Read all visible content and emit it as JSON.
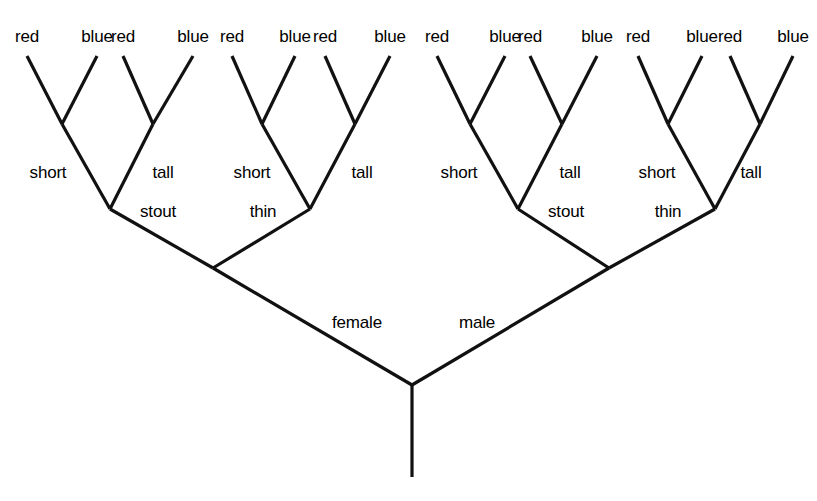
{
  "diagram": {
    "kind": "decision-tree",
    "title": "",
    "background_color": "#ffffff",
    "line_color": "#111111",
    "text_color": "#000000",
    "root": {
      "label": "",
      "stem": true
    },
    "level1": {
      "labels": [
        "female",
        "male"
      ]
    },
    "level2": {
      "labels": [
        "stout",
        "thin",
        "stout",
        "thin"
      ]
    },
    "level3": {
      "labels": [
        "short",
        "tall",
        "short",
        "tall",
        "short",
        "tall",
        "short",
        "tall"
      ]
    },
    "leaves": {
      "labels": [
        "red",
        "blue",
        "red",
        "blue",
        "red",
        "blue",
        "red",
        "blue",
        "red",
        "blue",
        "red",
        "blue",
        "red",
        "blue",
        "red",
        "blue"
      ]
    }
  },
  "chart_data": {
    "type": "diagram",
    "title": "",
    "structure": "binary decision tree, 4 levels of splits, 16 leaves",
    "splits": [
      {
        "level": 1,
        "attribute": "sex",
        "values": [
          "female",
          "male"
        ]
      },
      {
        "level": 2,
        "attribute": "build",
        "values": [
          "stout",
          "thin"
        ]
      },
      {
        "level": 3,
        "attribute": "height",
        "values": [
          "short",
          "tall"
        ]
      },
      {
        "level": 4,
        "attribute": "color",
        "values": [
          "red",
          "blue"
        ]
      }
    ],
    "leaf_count": 16,
    "leaf_labels": [
      "red",
      "blue",
      "red",
      "blue",
      "red",
      "blue",
      "red",
      "blue",
      "red",
      "blue",
      "red",
      "blue",
      "red",
      "blue",
      "red",
      "blue"
    ],
    "paths": [
      [
        "female",
        "stout",
        "short",
        "red"
      ],
      [
        "female",
        "stout",
        "short",
        "blue"
      ],
      [
        "female",
        "stout",
        "tall",
        "red"
      ],
      [
        "female",
        "stout",
        "tall",
        "blue"
      ],
      [
        "female",
        "thin",
        "short",
        "red"
      ],
      [
        "female",
        "thin",
        "short",
        "blue"
      ],
      [
        "female",
        "thin",
        "tall",
        "red"
      ],
      [
        "female",
        "thin",
        "tall",
        "blue"
      ],
      [
        "male",
        "stout",
        "short",
        "red"
      ],
      [
        "male",
        "stout",
        "short",
        "blue"
      ],
      [
        "male",
        "stout",
        "tall",
        "red"
      ],
      [
        "male",
        "stout",
        "tall",
        "blue"
      ],
      [
        "male",
        "thin",
        "short",
        "red"
      ],
      [
        "male",
        "thin",
        "short",
        "blue"
      ],
      [
        "male",
        "thin",
        "tall",
        "red"
      ],
      [
        "male",
        "thin",
        "tall",
        "blue"
      ]
    ]
  },
  "geometry": {
    "width": 817,
    "height": 501,
    "leaf_tips_x": [
      27,
      97,
      123,
      193,
      232,
      295,
      325,
      390,
      437,
      505,
      530,
      597,
      638,
      702,
      730,
      793
    ],
    "leaf_tip_y": 56,
    "level3_nodes": [
      {
        "x": 62,
        "y": 124
      },
      {
        "x": 153,
        "y": 124
      },
      {
        "x": 262,
        "y": 124
      },
      {
        "x": 355,
        "y": 124
      },
      {
        "x": 470,
        "y": 124
      },
      {
        "x": 562,
        "y": 124
      },
      {
        "x": 668,
        "y": 124
      },
      {
        "x": 760,
        "y": 124
      }
    ],
    "level2_nodes": [
      {
        "x": 110,
        "y": 209
      },
      {
        "x": 310,
        "y": 209
      },
      {
        "x": 518,
        "y": 209
      },
      {
        "x": 715,
        "y": 209
      }
    ],
    "level1_nodes": [
      {
        "x": 213,
        "y": 268
      },
      {
        "x": 609,
        "y": 268
      }
    ],
    "root_node": {
      "x": 412,
      "y": 385
    },
    "root_stem_bottom": {
      "x": 412,
      "y": 477
    },
    "stroke_width": 3.2,
    "leaf_label_y": 36,
    "level3_label_y": 172,
    "level2_label_y": 211,
    "level1_label_y": 322,
    "level3_label_x": [
      48,
      163,
      252,
      362,
      459,
      570,
      657,
      751
    ],
    "level2_label_x": [
      158,
      263,
      566,
      668
    ],
    "level1_label_x": [
      357,
      477
    ]
  }
}
